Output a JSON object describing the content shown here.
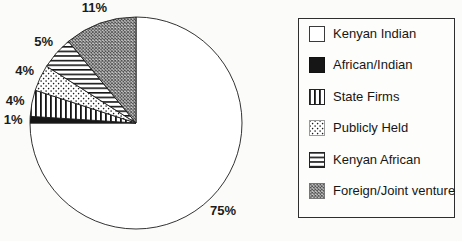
{
  "figure": {
    "kind": "scanned pie chart figure",
    "background": "#fbfbf9",
    "ink_color": "#1b1b1b"
  },
  "chart_data": {
    "type": "pie",
    "title": "",
    "start_angle_deg": 0,
    "direction": "clockwise",
    "legend_position": "right",
    "slices": [
      {
        "label": "Kenyan Indian",
        "value": 75,
        "pct_label": "75%",
        "pattern": "plain-white"
      },
      {
        "label": "African/Indian",
        "value": 1,
        "pct_label": "1%",
        "pattern": "solid-black"
      },
      {
        "label": "State Firms",
        "value": 4,
        "pct_label": "4%",
        "pattern": "vertical-lines"
      },
      {
        "label": "Publicly Held",
        "value": 4,
        "pct_label": "4%",
        "pattern": "dots"
      },
      {
        "label": "Kenyan African",
        "value": 5,
        "pct_label": "5%",
        "pattern": "horizontal-lines"
      },
      {
        "label": "Foreign/Joint venture",
        "value": 11,
        "pct_label": "11%",
        "pattern": "diagonal-crosshatch"
      }
    ]
  },
  "legend": {
    "items": [
      {
        "label": "Kenyan Indian",
        "pattern": "plain-white",
        "swatch_fill": "#ffffff",
        "swatch_stroke": "#3a3a3a"
      },
      {
        "label": "African/Indian",
        "pattern": "solid-black",
        "swatch_fill": "#161616",
        "swatch_stroke": "#111111"
      },
      {
        "label": "State Firms",
        "pattern": "vertical-lines",
        "swatch_fill": "url(#p-vlines)",
        "swatch_stroke": "#222222"
      },
      {
        "label": "Publicly Held",
        "pattern": "dots",
        "swatch_fill": "url(#p-dots)",
        "swatch_stroke": "#9a9a9a"
      },
      {
        "label": "Kenyan African",
        "pattern": "horizontal-lines",
        "swatch_fill": "url(#p-hlines)",
        "swatch_stroke": "#222222"
      },
      {
        "label": "Foreign/Joint venture",
        "pattern": "diagonal-crosshatch",
        "swatch_fill": "url(#p-crosshatch)",
        "swatch_stroke": "#777777"
      }
    ]
  }
}
